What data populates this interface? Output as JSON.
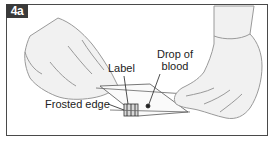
{
  "figure": {
    "badge": "4a",
    "callouts": {
      "label": "Label",
      "drop_line1": "Drop of",
      "drop_line2": "blood",
      "frosted_edge": "Frosted edge"
    },
    "colors": {
      "frame": "#4a4a4a",
      "badge_bg": "#3a3a3a",
      "badge_text": "#ffffff",
      "glove_fill": "#f1f1f1",
      "glove_stroke": "#9a9a9a",
      "callout_line": "#222222"
    }
  }
}
